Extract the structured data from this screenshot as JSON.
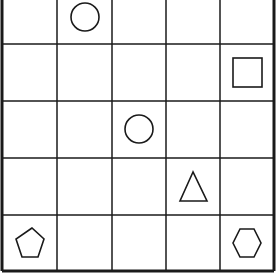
{
  "grid": {
    "rows": 5,
    "cols": 5,
    "col_lines": [
      2,
      57,
      112,
      166,
      220,
      274
    ],
    "row_lines": [
      -12,
      44,
      101,
      158,
      215,
      271
    ],
    "line_color": "#1a1a1a",
    "shape_color": "#1a1a1a"
  },
  "shapes": [
    {
      "type": "circle",
      "row": 0,
      "col": 1,
      "cx": 85,
      "cy": 17,
      "r": 14
    },
    {
      "type": "square",
      "row": 1,
      "col": 4,
      "x": 233,
      "y": 58,
      "size": 29
    },
    {
      "type": "circle",
      "row": 2,
      "col": 2,
      "cx": 139,
      "cy": 129,
      "r": 14
    },
    {
      "type": "triangle",
      "row": 3,
      "col": 3,
      "points": "193,172 180,201 207,201"
    },
    {
      "type": "pentagon",
      "row": 4,
      "col": 0,
      "points": "32,228 16,239 22,257 38,257 44,239"
    },
    {
      "type": "hexagon",
      "row": 4,
      "col": 4,
      "points": "240,229 254,229 261,243 254,257 240,257 233,243"
    }
  ]
}
